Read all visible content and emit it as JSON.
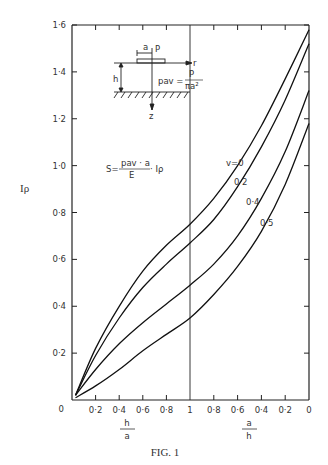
{
  "chart_data": {
    "type": "line",
    "title": "",
    "caption": "FIG. 1",
    "ylabel": "I_p",
    "ylabel_display": "Iρ",
    "xlabel_left": "h/a",
    "xlabel_right": "a/h",
    "ylim": [
      0,
      1.6
    ],
    "yticks": [
      "0",
      "0·2",
      "0·4",
      "0·6",
      "0·8",
      "1·0",
      "1·2",
      "1·4",
      "1·6"
    ],
    "xticks_left": [
      "0",
      "0·2",
      "0·4",
      "0·6",
      "0·8",
      "1"
    ],
    "xticks_right": [
      "0·8",
      "0·6",
      "0·4",
      "0·2",
      "0"
    ],
    "x_description": "Composite axis: left half h/a from 0 to 1, right half a/h from 1 to 0 (t = 0..2)",
    "x": [
      0.03,
      0.2,
      0.4,
      0.6,
      0.8,
      1.0,
      1.2,
      1.4,
      1.6,
      1.8,
      2.0
    ],
    "series": [
      {
        "name": "v=0",
        "values": [
          0.02,
          0.22,
          0.4,
          0.55,
          0.66,
          0.75,
          0.86,
          1.0,
          1.17,
          1.37,
          1.58
        ]
      },
      {
        "name": "v=0·2",
        "values": [
          0.02,
          0.19,
          0.35,
          0.48,
          0.58,
          0.67,
          0.77,
          0.91,
          1.08,
          1.28,
          1.52
        ]
      },
      {
        "name": "v=0·4",
        "values": [
          0.02,
          0.13,
          0.24,
          0.33,
          0.41,
          0.49,
          0.58,
          0.7,
          0.86,
          1.06,
          1.32
        ]
      },
      {
        "name": "v=0·5",
        "values": [
          0.01,
          0.06,
          0.13,
          0.21,
          0.28,
          0.35,
          0.45,
          0.57,
          0.72,
          0.92,
          1.18
        ]
      }
    ],
    "curve_labels": [
      "v=0",
      "0·2",
      "0·4",
      "0·5"
    ],
    "annotations": {
      "formula_s": "S = p_av · a / E · I_p",
      "formula_pav": "p_av = P / (π a²)",
      "inset": "Rigid circular plate of radius a with load P on layer of thickness h over rigid base; axes r and z"
    },
    "grid": false,
    "legend": "inline curve labels"
  },
  "text": {
    "s_eq": "S=",
    "s_num": "pav · a",
    "s_den": "E",
    "s_tail": "· Iρ",
    "pav_lhs": "pav =",
    "pav_num": "P",
    "pav_den": "πa²",
    "inset_a": "a",
    "inset_P": "P",
    "inset_r": "r",
    "inset_h": "h",
    "inset_z": "z"
  }
}
